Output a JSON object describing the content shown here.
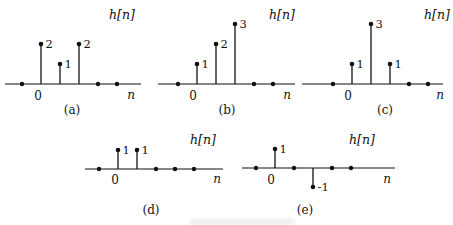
{
  "figure": {
    "ink_color": "#111111",
    "background_color": "#ffffff"
  },
  "chart_data": [
    {
      "id": "a",
      "type": "stem",
      "title": "h[n]",
      "xlabel": "n",
      "zero_tick": "0",
      "caption": "(a)",
      "x": [
        -1,
        0,
        1,
        2,
        3,
        4
      ],
      "values": [
        0,
        2,
        1,
        2,
        0,
        0
      ],
      "point_labels": [
        "",
        "2",
        "1",
        "2",
        "",
        ""
      ],
      "ylim": [
        -1,
        3
      ],
      "grid": false
    },
    {
      "id": "b",
      "type": "stem",
      "title": "h[n]",
      "xlabel": "n",
      "zero_tick": "0",
      "caption": "(b)",
      "x": [
        -1,
        0,
        1,
        2,
        3,
        4
      ],
      "values": [
        0,
        1,
        2,
        3,
        0,
        0
      ],
      "point_labels": [
        "",
        "1",
        "2",
        "3",
        "",
        ""
      ],
      "ylim": [
        -1,
        3
      ],
      "grid": false
    },
    {
      "id": "c",
      "type": "stem",
      "title": "h[n]",
      "xlabel": "n",
      "zero_tick": "0",
      "caption": "(c)",
      "x": [
        -1,
        0,
        1,
        2,
        3,
        4
      ],
      "values": [
        0,
        1,
        3,
        1,
        0,
        0
      ],
      "point_labels": [
        "",
        "1",
        "3",
        "1",
        "",
        ""
      ],
      "ylim": [
        -1,
        3
      ],
      "grid": false
    },
    {
      "id": "d",
      "type": "stem",
      "title": "h[n]",
      "xlabel": "n",
      "zero_tick": "0",
      "caption": "(d)",
      "x": [
        -1,
        0,
        1,
        2,
        3,
        4
      ],
      "values": [
        0,
        1,
        1,
        0,
        0,
        0
      ],
      "point_labels": [
        "",
        "1",
        "1",
        "",
        "",
        ""
      ],
      "ylim": [
        -1,
        3
      ],
      "grid": false
    },
    {
      "id": "e",
      "type": "stem",
      "title": "h[n]",
      "xlabel": "n",
      "zero_tick": "0",
      "caption": "(e)",
      "x": [
        -1,
        0,
        1,
        2,
        3,
        4
      ],
      "values": [
        0,
        1,
        0,
        -1,
        0,
        0
      ],
      "point_labels": [
        "",
        "1",
        "",
        "-1",
        "",
        ""
      ],
      "ylim": [
        -1,
        3
      ],
      "grid": false
    }
  ]
}
